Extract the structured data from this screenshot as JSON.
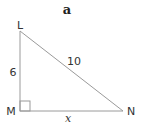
{
  "figure": {
    "title": "a",
    "vertices": {
      "L": {
        "label": "L",
        "x": 20,
        "y": 31
      },
      "M": {
        "label": "M",
        "x": 20,
        "y": 111
      },
      "N": {
        "label": "N",
        "x": 123,
        "y": 111
      }
    },
    "sides": {
      "LM": {
        "label": "6"
      },
      "LN": {
        "label": "10"
      },
      "MN": {
        "label": "x"
      }
    },
    "right_angle_at": "M",
    "colors": {
      "line": "#9a9a9a",
      "text": "#333333"
    }
  }
}
